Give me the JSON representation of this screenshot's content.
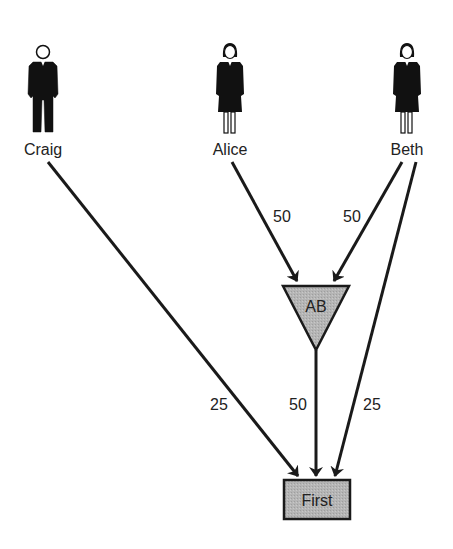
{
  "diagram": {
    "people": [
      {
        "name": "Craig",
        "gender": "male",
        "x": 43
      },
      {
        "name": "Alice",
        "gender": "female",
        "x": 230
      },
      {
        "name": "Beth",
        "gender": "female",
        "x": 407
      }
    ],
    "nodes": {
      "ab": {
        "label": "AB",
        "shape": "inverted-triangle",
        "fill": "#b3b3b3"
      },
      "first": {
        "label": "First",
        "shape": "rectangle",
        "fill": "#b3b3b3"
      }
    },
    "edges": [
      {
        "from": "Alice",
        "to": "AB",
        "weight": "50"
      },
      {
        "from": "Beth",
        "to": "AB",
        "weight": "50"
      },
      {
        "from": "Craig",
        "to": "First",
        "weight": "25"
      },
      {
        "from": "AB",
        "to": "First",
        "weight": "50"
      },
      {
        "from": "Beth",
        "to": "First",
        "weight": "25"
      }
    ],
    "colors": {
      "line": "#1a1a1a",
      "node_fill": "#b3b3b3",
      "background": "#ffffff"
    }
  }
}
